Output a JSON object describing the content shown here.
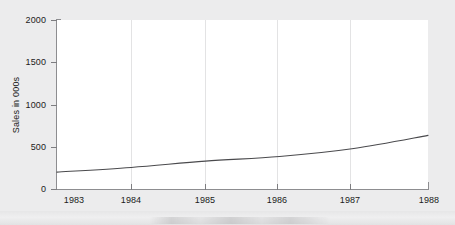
{
  "chart_data": {
    "type": "line",
    "title": "",
    "xlabel": "",
    "ylabel": "Sales in 000s",
    "x": [
      1983,
      1984,
      1985,
      1986,
      1987,
      1988
    ],
    "categories": [
      "1983",
      "1984",
      "1985",
      "1986",
      "1987",
      "1988"
    ],
    "series": [
      {
        "name": "Sales",
        "values": [
          200,
          255,
          330,
          385,
          480,
          635
        ],
        "color": "#4a4a4d"
      }
    ],
    "xlim": [
      1983,
      1988
    ],
    "ylim": [
      0,
      2000
    ],
    "ytick_values": [
      0,
      500,
      1000,
      1500,
      2000
    ],
    "ytick_labels": [
      "0",
      "500",
      "1000",
      "1500",
      "2000"
    ],
    "xtick_labels": [
      "1983",
      "1984",
      "1985",
      "1986",
      "1987",
      "1988"
    ],
    "grid": "vertical",
    "legend": "none",
    "plot_background": "#ffffff",
    "figure_background": "#ececed",
    "axis_color": "#8d8d90",
    "gridline_color": "#e3e3e4",
    "text_color": "#1b1b1b"
  }
}
